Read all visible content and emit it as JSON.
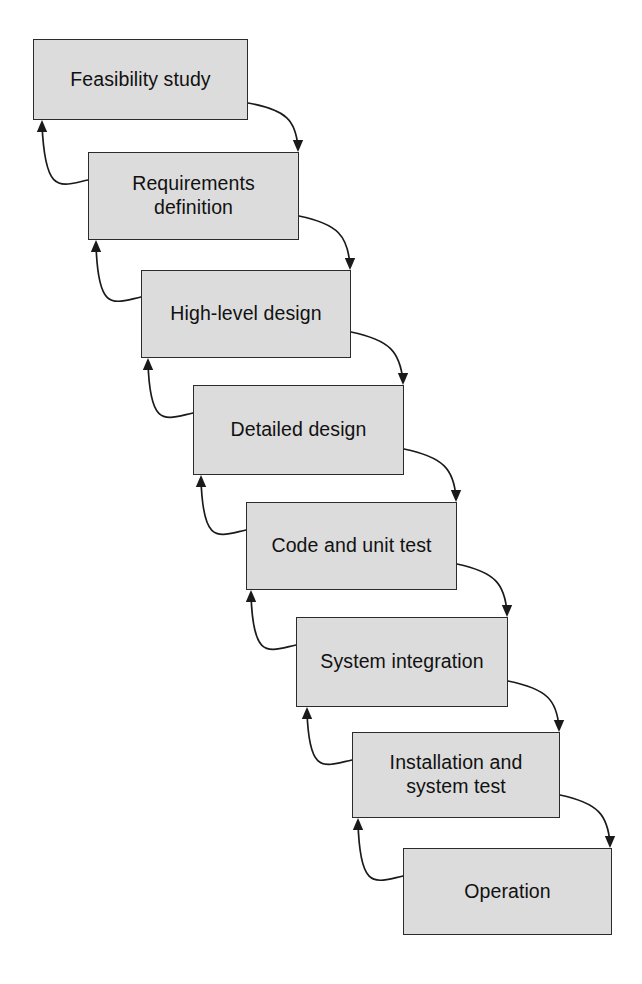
{
  "diagram": {
    "type": "flow-diagram",
    "width": 642,
    "height": 984,
    "background_color": "#ffffff",
    "box_fill_color": "#dcdcdc",
    "box_border_color": "#2b2b2b",
    "text_color": "#111111",
    "arrow_color": "#1a1a1a",
    "stages": [
      {
        "id": "feasibility-study",
        "label": "Feasibility study",
        "x": 33,
        "y": 39,
        "w": 215,
        "h": 81
      },
      {
        "id": "requirements-definition",
        "label": "Requirements\ndefinition",
        "x": 88,
        "y": 152,
        "w": 211,
        "h": 88
      },
      {
        "id": "high-level-design",
        "label": "High-level design",
        "x": 141,
        "y": 270,
        "w": 210,
        "h": 88
      },
      {
        "id": "detailed-design",
        "label": "Detailed design",
        "x": 193,
        "y": 385,
        "w": 211,
        "h": 90
      },
      {
        "id": "code-and-unit-test",
        "label": "Code and unit test",
        "x": 246,
        "y": 502,
        "w": 211,
        "h": 88
      },
      {
        "id": "system-integration",
        "label": "System integration",
        "x": 296,
        "y": 617,
        "w": 212,
        "h": 90
      },
      {
        "id": "installation-and-system-test",
        "label": "Installation and\nsystem test",
        "x": 352,
        "y": 732,
        "w": 208,
        "h": 86
      },
      {
        "id": "operation",
        "label": "Operation",
        "x": 403,
        "y": 848,
        "w": 209,
        "h": 87
      }
    ],
    "forward_arrows": [
      {
        "id": "forward-1",
        "from": "feasibility-study",
        "to": "requirements-definition",
        "path": "M 248 103 C 286 110 296 120 298 148",
        "tip_x": 298,
        "tip_y": 152
      },
      {
        "id": "forward-2",
        "from": "requirements-definition",
        "to": "high-level-design",
        "path": "M 299 216 C 338 224 348 236 350 266",
        "tip_x": 350,
        "tip_y": 270
      },
      {
        "id": "forward-3",
        "from": "high-level-design",
        "to": "detailed-design",
        "path": "M 351 332 C 390 340 400 352 403 381",
        "tip_x": 403,
        "tip_y": 385
      },
      {
        "id": "forward-4",
        "from": "detailed-design",
        "to": "code-and-unit-test",
        "path": "M 404 449 C 443 457 454 469 456 498",
        "tip_x": 456,
        "tip_y": 502
      },
      {
        "id": "forward-5",
        "from": "code-and-unit-test",
        "to": "system-integration",
        "path": "M 457 564 C 495 572 505 584 507 613",
        "tip_x": 507,
        "tip_y": 617
      },
      {
        "id": "forward-6",
        "from": "system-integration",
        "to": "installation-and-system-test",
        "path": "M 508 681 C 547 689 557 700 559 728",
        "tip_x": 559,
        "tip_y": 732
      },
      {
        "id": "forward-7",
        "from": "installation-and-system-test",
        "to": "operation",
        "path": "M 560 795 C 598 803 608 815 610 844",
        "tip_x": 610,
        "tip_y": 848
      }
    ],
    "feedback_arrows": [
      {
        "id": "feedback-1",
        "from": "requirements-definition",
        "to": "feasibility-study",
        "path": "M 88 180 C 60 186 45 196 42 124",
        "tip_x": 42,
        "tip_y": 120
      },
      {
        "id": "feedback-2",
        "from": "high-level-design",
        "to": "requirements-definition",
        "path": "M 141 297 C 113 303 98 313 96 244",
        "tip_x": 96,
        "tip_y": 240
      },
      {
        "id": "feedback-3",
        "from": "detailed-design",
        "to": "high-level-design",
        "path": "M 193 413 C 165 419 150 429 148 362",
        "tip_x": 148,
        "tip_y": 358
      },
      {
        "id": "feedback-4",
        "from": "code-and-unit-test",
        "to": "detailed-design",
        "path": "M 246 530 C 218 536 203 546 201 479",
        "tip_x": 201,
        "tip_y": 475
      },
      {
        "id": "feedback-5",
        "from": "system-integration",
        "to": "code-and-unit-test",
        "path": "M 296 645 C 268 651 253 661 251 594",
        "tip_x": 251,
        "tip_y": 590
      },
      {
        "id": "feedback-6",
        "from": "installation-and-system-test",
        "to": "system-integration",
        "path": "M 352 760 C 324 766 309 776 307 711",
        "tip_x": 307,
        "tip_y": 707
      },
      {
        "id": "feedback-7",
        "from": "operation",
        "to": "installation-and-system-test",
        "path": "M 403 876 C 375 882 360 892 358 822",
        "tip_x": 358,
        "tip_y": 818
      }
    ]
  }
}
